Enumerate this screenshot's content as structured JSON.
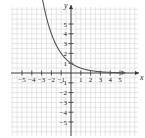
{
  "chart_data": {
    "type": "line",
    "title": "",
    "xlabel": "x",
    "ylabel": "y",
    "xlim": [
      -6.2,
      6.6
    ],
    "ylim": [
      -6.4,
      6.6
    ],
    "grid": true,
    "legend": null,
    "x_ticks": [
      -5,
      -4,
      -3,
      -2,
      -1,
      1,
      2,
      3,
      4,
      5
    ],
    "y_ticks": [
      -5,
      -4,
      -3,
      -2,
      -1,
      1,
      2,
      3,
      4,
      5
    ],
    "x_tick_labels": [
      "−5",
      "−4",
      "−3",
      "−2",
      "−1",
      "1",
      "2",
      "3",
      "4",
      "5"
    ],
    "y_tick_labels": [
      "−5",
      "−4",
      "−3",
      "−2",
      "−1",
      "1",
      "2",
      "3",
      "4",
      "5"
    ],
    "series": [
      {
        "name": "y = (1/2)^x",
        "function": "2^(-x)",
        "x": [
          -3.2,
          -3,
          -2.5,
          -2,
          -1.5,
          -1,
          -0.5,
          0,
          1,
          2,
          3,
          4,
          5,
          5.5
        ],
        "y": [
          9.19,
          8,
          5.66,
          4,
          2.83,
          2,
          1.41,
          1,
          0.5,
          0.25,
          0.125,
          0.0625,
          0.03125,
          0.022
        ],
        "arrows": "both",
        "color": "#555555"
      }
    ],
    "key_points": [
      {
        "x": -2,
        "y": 4
      },
      {
        "x": -1,
        "y": 2
      },
      {
        "x": 0,
        "y": 1
      },
      {
        "x": 1,
        "y": 0.5
      }
    ]
  },
  "colors": {
    "grid": "#cfcfcf",
    "axis": "#333333",
    "curve": "#555555"
  }
}
